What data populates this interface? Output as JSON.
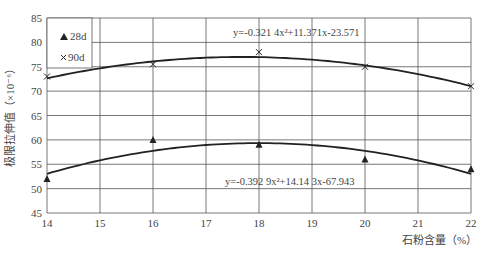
{
  "chart_data": {
    "type": "scatter",
    "title": "",
    "xlabel": "石粉含量（%）",
    "ylabel": "极限拉伸值（×10⁻⁶）",
    "xlim": [
      14,
      22
    ],
    "ylim": [
      45,
      85
    ],
    "x_ticks": [
      "14",
      "15",
      "16",
      "17",
      "18",
      "19",
      "20",
      "21",
      "22"
    ],
    "y_ticks": [
      "45",
      "50",
      "55",
      "60",
      "65",
      "70",
      "75",
      "80",
      "85"
    ],
    "grid": true,
    "legend_position": "upper-left",
    "series": [
      {
        "name": "28d",
        "marker": "triangle",
        "x": [
          14,
          16,
          18,
          20,
          22
        ],
        "values": [
          52,
          60,
          59,
          56,
          54
        ],
        "fit": {
          "a": -0.3929,
          "b": 14.143,
          "c": -67.943
        },
        "equation": "y=-0.392 9x²+14.14 3x-67.943"
      },
      {
        "name": "90d",
        "marker": "x",
        "x": [
          14,
          16,
          18,
          20,
          22
        ],
        "values": [
          73,
          75.5,
          78,
          75,
          71
        ],
        "fit": {
          "a": -0.3214,
          "b": 11.371,
          "c": -23.571
        },
        "equation": "y=-0.321 4x²+11.371x-23.571"
      }
    ]
  },
  "legend": {
    "item1": "28d",
    "item2": "90d"
  },
  "labels": {
    "xlabel": "石粉含量（%）",
    "ylabel": "极限拉伸值（×10⁻⁶）",
    "eq90": "y=-0.321 4x²+11.371x-23.571",
    "eq28": "y=-0.392 9x²+14.14 3x-67.943"
  },
  "colors": {
    "line": "#222222",
    "grid": "#555555",
    "text": "#444444"
  }
}
